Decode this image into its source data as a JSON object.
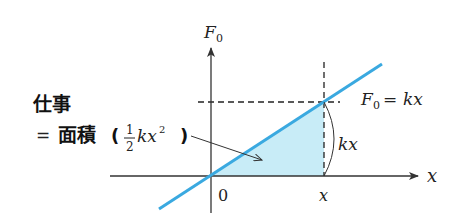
{
  "diagram": {
    "y_axis_label": "F",
    "y_axis_label_sub": "0",
    "x_axis_label": "x",
    "origin_label": "0",
    "x_tick_label": "x",
    "line_label": {
      "lhs": "F",
      "lhs_sub": "0",
      "eq": "=",
      "rhs": "kx"
    },
    "height_label": "kx",
    "annotation": {
      "line1": "仕事",
      "line2_eq": "=",
      "line2_word": "面積",
      "paren_open": "(",
      "frac_num": "1",
      "frac_den": "2",
      "expr": "kx",
      "expr_exp": "2",
      "paren_close": ")"
    },
    "colors": {
      "line": "#3aa9e0",
      "fill": "#c8ecf7",
      "axis": "#333333"
    },
    "geometry": {
      "origin": [
        211,
        176
      ],
      "intersection": [
        324,
        102
      ]
    }
  }
}
